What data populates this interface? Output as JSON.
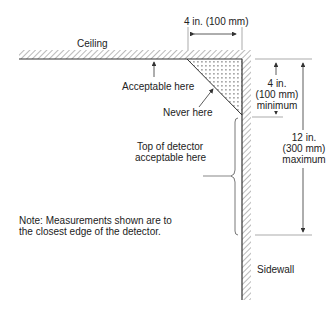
{
  "labels": {
    "ceiling": "Ceiling",
    "sidewall": "Sidewall",
    "acceptable_here": "Acceptable here",
    "never_here": "Never here",
    "top_detector_line1": "Top of detector",
    "top_detector_line2": "acceptable here",
    "note_line1": "Note: Measurements shown are to",
    "note_line2": "the closest edge of the detector."
  },
  "dimensions": {
    "horizontal": "4 in. (100 mm)",
    "min_line1": "4 in.",
    "min_line2": "(100 mm)",
    "min_line3": "minimum",
    "max_line1": "12 in.",
    "max_line2": "(300 mm)",
    "max_line3": "maximum"
  },
  "colors": {
    "line": "#333333",
    "hatch": "#555555",
    "dimension": "#666666"
  }
}
